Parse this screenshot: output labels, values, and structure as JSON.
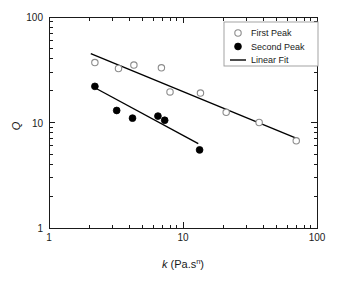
{
  "chart_data": {
    "type": "scatter",
    "title": "",
    "xlabel": "k (Pa.sⁿ)",
    "xlabel_main": "k",
    "xlabel_paren_open": " (Pa.s",
    "xlabel_sup": "n",
    "xlabel_paren_close": ")",
    "ylabel": "Q",
    "xscale": "log",
    "yscale": "log",
    "xlim": [
      1,
      100
    ],
    "ylim": [
      1,
      100
    ],
    "xticks": [
      1,
      10,
      100
    ],
    "xticklabels": [
      "1",
      "10",
      "100"
    ],
    "yticks": [
      1,
      10,
      100
    ],
    "yticklabels": [
      "1",
      "10",
      "100"
    ],
    "grid": false,
    "legend_position": "top-right",
    "series": [
      {
        "name": "First Peak",
        "marker": "open-circle",
        "color": "#000000",
        "points": [
          {
            "x": 2.2,
            "y": 37.0
          },
          {
            "x": 3.3,
            "y": 32.5
          },
          {
            "x": 4.3,
            "y": 35.0
          },
          {
            "x": 6.9,
            "y": 33.0
          },
          {
            "x": 8.0,
            "y": 19.5
          },
          {
            "x": 13.5,
            "y": 19.0
          },
          {
            "x": 21.0,
            "y": 12.5
          },
          {
            "x": 37.0,
            "y": 10.0
          },
          {
            "x": 70.0,
            "y": 6.7
          }
        ]
      },
      {
        "name": "Second Peak",
        "marker": "filled-circle",
        "color": "#000000",
        "points": [
          {
            "x": 2.2,
            "y": 22.0
          },
          {
            "x": 3.2,
            "y": 13.0
          },
          {
            "x": 4.2,
            "y": 11.0
          },
          {
            "x": 6.5,
            "y": 11.5
          },
          {
            "x": 7.3,
            "y": 10.5
          },
          {
            "x": 13.3,
            "y": 5.5
          }
        ]
      }
    ],
    "fits": [
      {
        "name": "Linear Fit",
        "for_series": "First Peak",
        "color": "#000000",
        "x_start": 2.05,
        "y_start": 45.0,
        "x_end": 72.0,
        "y_end": 7.0
      },
      {
        "name": "Linear Fit",
        "for_series": "Second Peak",
        "color": "#000000",
        "x_start": 2.25,
        "y_start": 21.0,
        "x_end": 13.0,
        "y_end": 6.3
      }
    ],
    "legend": [
      {
        "label": "First Peak",
        "marker": "open-circle"
      },
      {
        "label": "Second Peak",
        "marker": "filled-circle"
      },
      {
        "label": "Linear Fit",
        "marker": "line"
      }
    ]
  }
}
